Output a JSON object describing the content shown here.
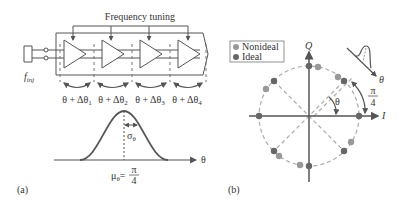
{
  "figure": {
    "panel_a": {
      "label": "(a)",
      "title": "Frequency tuning",
      "input_label": "f",
      "input_subscript": "inj",
      "stages": [
        {
          "label": "θ + Δθ",
          "sub": "1"
        },
        {
          "label": "θ + Δθ",
          "sub": "2"
        },
        {
          "label": "θ + Δθ",
          "sub": "3"
        },
        {
          "label": "θ + Δθ",
          "sub": "4"
        }
      ],
      "distribution": {
        "axis_label": "θ",
        "sigma_label": "σ",
        "sigma_sub": "θ",
        "mean_label": "μ",
        "mean_sub": "θ",
        "mean_eq": "=",
        "mean_num": "π",
        "mean_den": "4"
      }
    },
    "panel_b": {
      "label": "(b)",
      "legend": [
        {
          "label": "Nonideal",
          "color": "#999999"
        },
        {
          "label": "Ideal",
          "color": "#666666"
        }
      ],
      "axis_i": "I",
      "axis_q": "Q",
      "angle_label": "θ",
      "step_num": "π",
      "step_den": "4",
      "dist_axis_label": "θ"
    },
    "colors": {
      "line": "#555555",
      "dashed": "#aaaaaa",
      "ideal": "#666666",
      "nonideal": "#999999"
    }
  }
}
